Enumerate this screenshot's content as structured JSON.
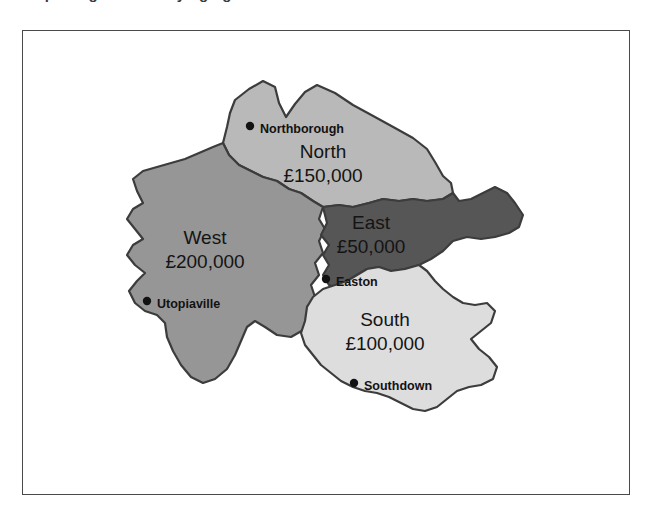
{
  "page": {
    "clipped_heading_fragment": "Exporting the underlying figure",
    "background_color": "#ffffff"
  },
  "figure": {
    "frame_border_color": "#4a4a4a",
    "outline_color": "#3c3c3c",
    "map_title": "",
    "regions": [
      {
        "id": "north",
        "name": "North",
        "value": "£150,000",
        "fill": "#b9b9b9",
        "name_x": 300,
        "name_y": 122,
        "value_x": 300,
        "value_y": 146,
        "city": {
          "name": "Northborough",
          "dot_x": 227,
          "dot_y": 95,
          "label_x": 237,
          "label_y": 99
        }
      },
      {
        "id": "west",
        "name": "West",
        "value": "£200,000",
        "fill": "#969696",
        "name_x": 182,
        "name_y": 208,
        "value_x": 182,
        "value_y": 232,
        "city": {
          "name": "Utopiaville",
          "dot_x": 124,
          "dot_y": 270,
          "label_x": 134,
          "label_y": 274
        }
      },
      {
        "id": "east",
        "name": "East",
        "value": "£50,000",
        "fill": "#565656",
        "name_x": 348,
        "name_y": 193,
        "value_x": 348,
        "value_y": 217,
        "city": {
          "name": "Easton",
          "dot_x": 303,
          "dot_y": 248,
          "label_x": 313,
          "label_y": 252
        }
      },
      {
        "id": "south",
        "name": "South",
        "value": "£100,000",
        "fill": "#dddddd",
        "name_x": 362,
        "name_y": 290,
        "value_x": 362,
        "value_y": 314,
        "city": {
          "name": "Southdown",
          "dot_x": 331,
          "dot_y": 352,
          "label_x": 341,
          "label_y": 356
        }
      }
    ]
  }
}
